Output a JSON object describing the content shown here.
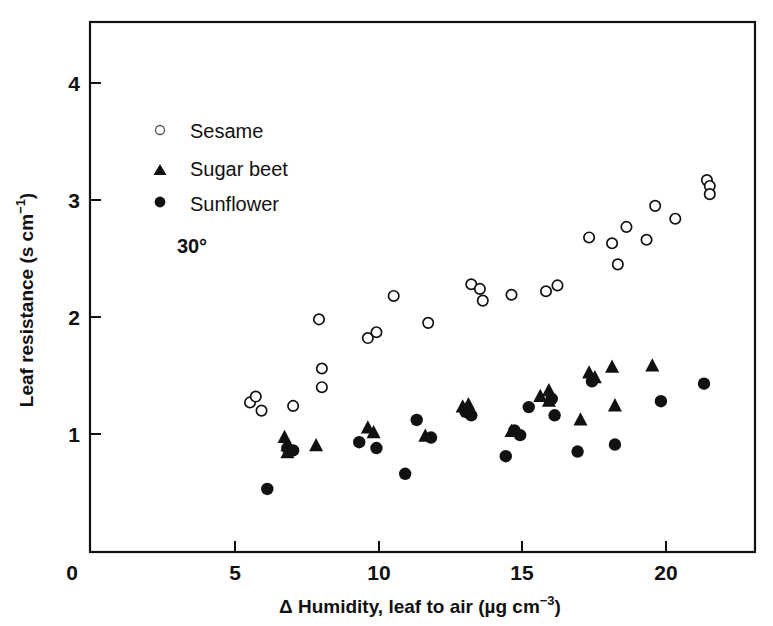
{
  "chart_data": {
    "type": "scatter",
    "title": "",
    "xlabel": "Δ Humidity, leaf to air (µg cm−3)",
    "ylabel": "Leaf resistance (s cm−1)",
    "xlim": [
      0,
      23.2
    ],
    "ylim": [
      0,
      4.55
    ],
    "xticks": [
      0,
      5,
      10,
      15,
      20
    ],
    "xticklabels": [
      "0",
      "5",
      "10",
      "15",
      "20"
    ],
    "yticks": [
      1,
      2,
      3,
      4
    ],
    "yticklabels": [
      "1",
      "2",
      "3",
      "4"
    ],
    "grid": false,
    "legend_position": "upper-left-inside",
    "annotations": [
      {
        "text": "30°",
        "x": 4.2,
        "y": 2.65
      }
    ],
    "series": [
      {
        "name": "Sesame",
        "marker": "open-circle",
        "color": "#ffffff",
        "edge_color": "#111111",
        "points": [
          [
            5.5,
            1.27
          ],
          [
            5.7,
            1.32
          ],
          [
            5.9,
            1.2
          ],
          [
            7.0,
            1.24
          ],
          [
            7.9,
            1.98
          ],
          [
            8.0,
            1.56
          ],
          [
            8.0,
            1.4
          ],
          [
            9.6,
            1.82
          ],
          [
            9.9,
            1.87
          ],
          [
            10.5,
            2.18
          ],
          [
            11.7,
            1.95
          ],
          [
            13.2,
            2.28
          ],
          [
            13.5,
            2.24
          ],
          [
            13.6,
            2.14
          ],
          [
            14.6,
            2.19
          ],
          [
            15.8,
            2.22
          ],
          [
            16.2,
            2.27
          ],
          [
            17.3,
            2.68
          ],
          [
            18.1,
            2.63
          ],
          [
            18.3,
            2.45
          ],
          [
            18.6,
            2.77
          ],
          [
            19.3,
            2.66
          ],
          [
            19.6,
            2.95
          ],
          [
            20.3,
            2.84
          ],
          [
            21.4,
            3.17
          ],
          [
            21.5,
            3.12
          ],
          [
            21.5,
            3.05
          ]
        ]
      },
      {
        "name": "Sugar beet",
        "marker": "filled-triangle",
        "color": "#111111",
        "points": [
          [
            6.7,
            0.97
          ],
          [
            6.8,
            0.9
          ],
          [
            6.8,
            0.84
          ],
          [
            7.8,
            0.9
          ],
          [
            9.6,
            1.05
          ],
          [
            9.8,
            1.01
          ],
          [
            11.6,
            0.98
          ],
          [
            12.9,
            1.23
          ],
          [
            13.1,
            1.25
          ],
          [
            14.6,
            1.02
          ],
          [
            15.6,
            1.32
          ],
          [
            15.9,
            1.37
          ],
          [
            15.9,
            1.28
          ],
          [
            17.0,
            1.12
          ],
          [
            17.3,
            1.52
          ],
          [
            17.5,
            1.48
          ],
          [
            18.1,
            1.57
          ],
          [
            18.2,
            1.24
          ],
          [
            19.5,
            1.58
          ]
        ]
      },
      {
        "name": "Sunflower",
        "marker": "filled-circle",
        "color": "#111111",
        "points": [
          [
            6.1,
            0.53
          ],
          [
            6.8,
            0.88
          ],
          [
            7.0,
            0.86
          ],
          [
            9.3,
            0.93
          ],
          [
            9.9,
            0.88
          ],
          [
            10.9,
            0.66
          ],
          [
            11.3,
            1.12
          ],
          [
            11.8,
            0.97
          ],
          [
            13.0,
            1.19
          ],
          [
            13.2,
            1.16
          ],
          [
            14.4,
            0.81
          ],
          [
            14.7,
            1.03
          ],
          [
            14.9,
            0.99
          ],
          [
            15.2,
            1.23
          ],
          [
            16.0,
            1.3
          ],
          [
            16.1,
            1.16
          ],
          [
            16.9,
            0.85
          ],
          [
            17.4,
            1.45
          ],
          [
            18.2,
            0.91
          ],
          [
            19.8,
            1.28
          ],
          [
            21.3,
            1.43
          ]
        ]
      }
    ]
  },
  "legend": {
    "entries": [
      {
        "label": "Sesame",
        "marker": "open-circle-icon"
      },
      {
        "label": "Sugar beet",
        "marker": "filled-triangle-icon"
      },
      {
        "label": "Sunflower",
        "marker": "filled-circle-icon"
      }
    ]
  },
  "axis_text": {
    "x_prefix": "Δ Humidity, leaf to air (µg cm",
    "x_exponent": "−3",
    "x_suffix": ")",
    "y_prefix": "Leaf resistance (s cm",
    "y_exponent": "−1",
    "y_suffix": ")"
  },
  "temperature_label": "30°"
}
